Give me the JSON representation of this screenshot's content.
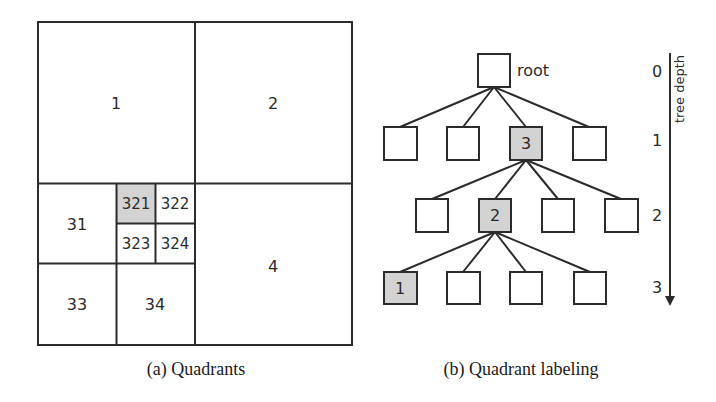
{
  "figure_a": {
    "caption": "(a) Quadrants",
    "quadrants": {
      "q1": "1",
      "q2": "2",
      "q4": "4",
      "q31": "31",
      "q33": "33",
      "q34": "34",
      "q321": "321",
      "q322": "322",
      "q323": "323",
      "q324": "324"
    },
    "highlighted_cell": "321",
    "highlight_color": "#d3d3d3"
  },
  "figure_b": {
    "caption": "(b) Quadrant labeling",
    "root_label": "root",
    "highlighted_nodes": {
      "level1": "3",
      "level2": "2",
      "level3": "1"
    },
    "depth_axis": {
      "title": "tree depth",
      "ticks": [
        "0",
        "1",
        "2",
        "3"
      ]
    },
    "highlight_color": "#d3d3d3"
  }
}
